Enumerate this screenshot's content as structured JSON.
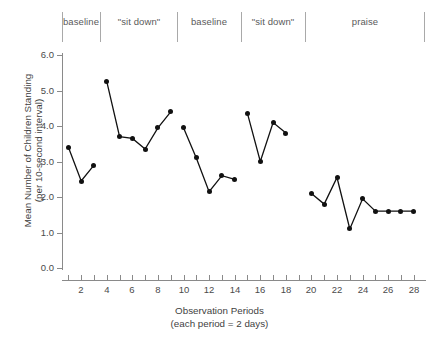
{
  "chart_data": {
    "type": "line",
    "title": "",
    "xlabel": "Observation Periods",
    "xlabel_sub": "(each period = 2 days)",
    "ylabel_line1": "Mean Number of Children Standing",
    "ylabel_line2": "(per 10-second interval)",
    "ylim": [
      0.0,
      6.0
    ],
    "ytick_labels": [
      "6.0",
      "5.0",
      "4.0",
      "3.0",
      "2.0",
      "1.0",
      "0.0"
    ],
    "ytick_values": [
      6.0,
      5.0,
      4.0,
      3.0,
      2.0,
      1.0,
      0.0
    ],
    "xlim": [
      0.5,
      28.8
    ],
    "xtick_values": [
      1,
      2,
      3,
      4,
      5,
      6,
      7,
      8,
      9,
      10,
      11,
      12,
      13,
      14,
      15,
      16,
      17,
      18,
      19,
      20,
      21,
      22,
      23,
      24,
      25,
      26,
      27,
      28
    ],
    "xtick_labels": [
      "",
      "2",
      "",
      "4",
      "",
      "6",
      "",
      "8",
      "",
      "10",
      "",
      "12",
      "",
      "14",
      "",
      "16",
      "",
      "18",
      "",
      "20",
      "",
      "22",
      "",
      "24",
      "",
      "26",
      "",
      "28"
    ],
    "grid": false,
    "legend": "none",
    "marker": "filled-circle",
    "line_color": "#111111",
    "marker_color": "#111111",
    "phases": [
      {
        "label": "baseline",
        "x_start": 1,
        "x_end": 3
      },
      {
        "label": "\"sit down\"",
        "x_start": 4,
        "x_end": 9
      },
      {
        "label": "baseline",
        "x_start": 10,
        "x_end": 14
      },
      {
        "label": "\"sit down\"",
        "x_start": 15,
        "x_end": 19
      },
      {
        "label": "praise",
        "x_start": 20,
        "x_end": 28
      }
    ],
    "phase_divider_x": [
      0.5,
      3.5,
      9.5,
      14.5,
      19.5,
      28.8
    ],
    "series": [
      {
        "name": "baseline-1",
        "x": [
          1,
          2,
          3
        ],
        "values": [
          3.4,
          2.45,
          2.9
        ]
      },
      {
        "name": "sit-down-1",
        "x": [
          4,
          5,
          6,
          7,
          8,
          9
        ],
        "values": [
          5.25,
          3.7,
          3.65,
          3.35,
          3.95,
          4.4
        ]
      },
      {
        "name": "baseline-2",
        "x": [
          10,
          11,
          12,
          13,
          14
        ],
        "values": [
          3.95,
          3.1,
          2.15,
          2.6,
          2.5
        ]
      },
      {
        "name": "sit-down-2",
        "x": [
          15,
          16,
          17,
          18
        ],
        "values": [
          4.35,
          3.0,
          4.1,
          3.8
        ]
      },
      {
        "name": "praise",
        "x": [
          20,
          21,
          22,
          23,
          24,
          25,
          26,
          27,
          28
        ],
        "values": [
          2.1,
          1.8,
          2.55,
          1.1,
          1.95,
          1.6,
          1.6,
          1.6,
          1.6
        ]
      }
    ]
  }
}
